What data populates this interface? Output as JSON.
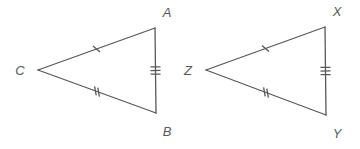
{
  "figure": {
    "background_color": "#ffffff",
    "stroke_color": "#58585a",
    "label_color": "#58585a",
    "stroke_width": 1.3
  },
  "triangles": [
    {
      "name": "triangle-abc",
      "vertices": [
        {
          "label": "A",
          "x": 155,
          "y": 28,
          "label_x": 167,
          "label_y": 17
        },
        {
          "label": "B",
          "x": 156,
          "y": 113,
          "label_x": 167,
          "label_y": 136
        },
        {
          "label": "C",
          "x": 38,
          "y": 70,
          "label_x": 20,
          "label_y": 75
        }
      ],
      "sides": [
        {
          "name": "side-ca",
          "from": "C",
          "to": "A",
          "ticks": 1,
          "tick_style": "slash"
        },
        {
          "name": "side-cb",
          "from": "C",
          "to": "B",
          "ticks": 2,
          "tick_style": "slash"
        },
        {
          "name": "side-ab",
          "from": "A",
          "to": "B",
          "ticks": 3,
          "tick_style": "cross"
        }
      ]
    },
    {
      "name": "triangle-xyz",
      "vertices": [
        {
          "label": "X",
          "x": 325,
          "y": 27,
          "label_x": 337,
          "label_y": 16
        },
        {
          "label": "Y",
          "x": 326,
          "y": 115,
          "label_x": 337,
          "label_y": 138
        },
        {
          "label": "Z",
          "x": 206,
          "y": 70,
          "label_x": 188,
          "label_y": 75
        }
      ],
      "sides": [
        {
          "name": "side-zx",
          "from": "Z",
          "to": "X",
          "ticks": 1,
          "tick_style": "slash"
        },
        {
          "name": "side-zy",
          "from": "Z",
          "to": "Y",
          "ticks": 2,
          "tick_style": "slash"
        },
        {
          "name": "side-xy",
          "from": "X",
          "to": "Y",
          "ticks": 3,
          "tick_style": "cross"
        }
      ]
    }
  ]
}
